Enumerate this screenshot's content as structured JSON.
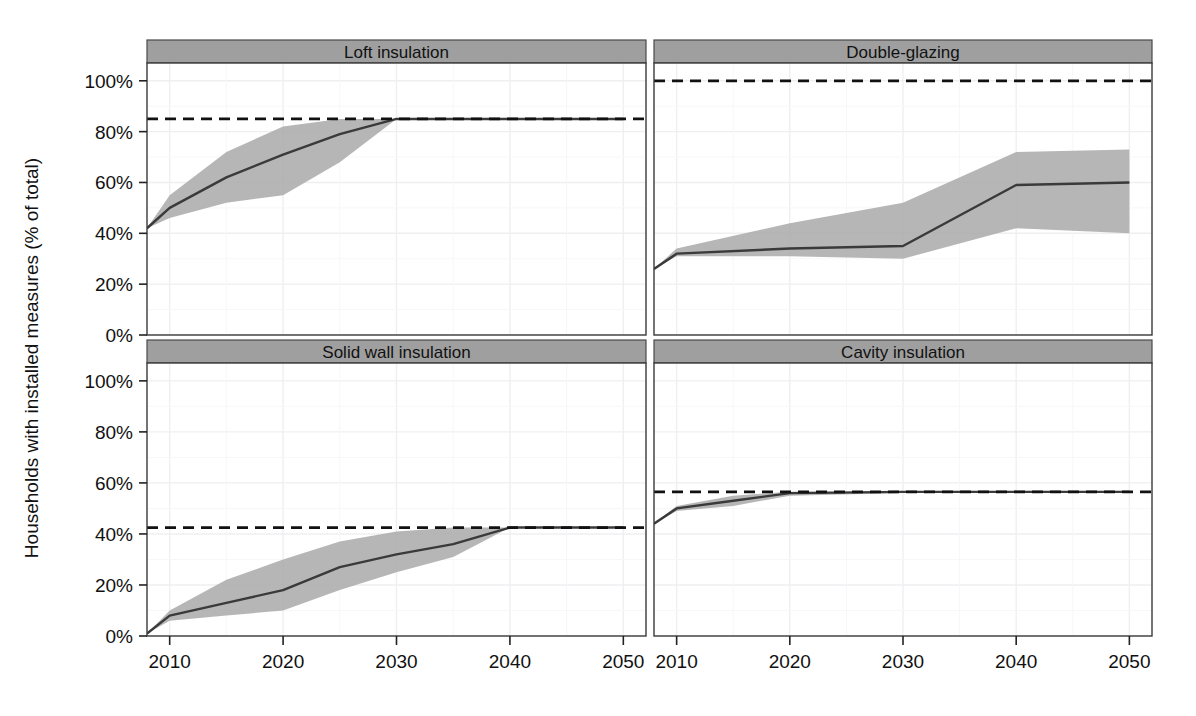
{
  "figure": {
    "ylabel": "Households with installed measures (% of total)",
    "xlabel": "",
    "title": ""
  },
  "axes": {
    "y_ticks": [
      "0%",
      "20%",
      "40%",
      "60%",
      "80%",
      "100%"
    ],
    "y_tick_values": [
      0,
      20,
      40,
      60,
      80,
      100
    ],
    "x_ticks": [
      "2010",
      "2020",
      "2030",
      "2040",
      "2050"
    ],
    "x_tick_values": [
      2010,
      2020,
      2030,
      2040,
      2050
    ],
    "xlim": [
      2008,
      2052
    ],
    "ylim": [
      -3,
      107
    ]
  },
  "style": {
    "strip_fill": "#9f9f9f",
    "strip_stroke": "#4a4a4a",
    "panel_stroke": "#3a3a3a",
    "panel_fill": "#ffffff",
    "grid_color": "#efeff2",
    "line_color": "#3a3a3a",
    "ribbon_fill": "#a9a9a9",
    "ribbon_opacity": 0.85,
    "target_color": "#111111"
  },
  "chart_data": {
    "type": "line",
    "title": "",
    "xlabel": "",
    "ylabel": "Households with installed measures (% of total)",
    "xlim": [
      2008,
      2052
    ],
    "ylim": [
      0,
      107
    ],
    "grid": true,
    "legend": "none",
    "x_ticks": [
      2010,
      2020,
      2030,
      2040,
      2050
    ],
    "y_ticks": [
      0,
      20,
      40,
      60,
      80,
      100
    ],
    "panels": [
      {
        "label": "Loft insulation",
        "row": 0,
        "col": 0,
        "target_line": 85,
        "x": [
          2008,
          2010,
          2015,
          2020,
          2025,
          2030,
          2035,
          2040,
          2045,
          2050
        ],
        "median": [
          42,
          50,
          62,
          71,
          79,
          85,
          85,
          85,
          85,
          85
        ],
        "lower": [
          42,
          46,
          52,
          55,
          68,
          85,
          85,
          85,
          85,
          85
        ],
        "upper": [
          42,
          55,
          72,
          82,
          85,
          85,
          85,
          85,
          85,
          85
        ]
      },
      {
        "label": "Double-glazing",
        "row": 0,
        "col": 1,
        "target_line": 100,
        "x": [
          2008,
          2010,
          2020,
          2030,
          2040,
          2050
        ],
        "median": [
          26,
          32,
          34,
          35,
          59,
          60
        ],
        "lower": [
          26,
          31,
          31,
          30,
          42,
          40
        ],
        "upper": [
          26,
          34,
          44,
          52,
          72,
          73
        ]
      },
      {
        "label": "Solid wall insulation",
        "row": 1,
        "col": 0,
        "target_line": 42.5,
        "x": [
          2008,
          2010,
          2015,
          2020,
          2025,
          2030,
          2035,
          2040,
          2045,
          2050
        ],
        "median": [
          1,
          8,
          13,
          18,
          27,
          32,
          36,
          42.5,
          42.5,
          42.5
        ],
        "lower": [
          1,
          6,
          8,
          10,
          18,
          25,
          31,
          42.5,
          42.5,
          42.5
        ],
        "upper": [
          1,
          10,
          22,
          30,
          37,
          41,
          42.5,
          42.5,
          42.5,
          42.5
        ]
      },
      {
        "label": "Cavity insulation",
        "row": 1,
        "col": 1,
        "target_line": 56.5,
        "x": [
          2008,
          2010,
          2015,
          2020,
          2030,
          2040,
          2050
        ],
        "median": [
          44,
          50,
          53,
          56,
          56.5,
          56.5,
          56.5
        ],
        "lower": [
          44,
          49,
          51,
          55,
          56,
          56.5,
          56.5
        ],
        "upper": [
          44,
          51,
          55,
          56.5,
          56.5,
          56.5,
          56.5
        ]
      }
    ]
  }
}
